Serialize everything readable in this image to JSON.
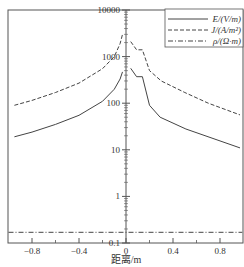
{
  "chart_data": {
    "type": "line",
    "title": "",
    "xlabel": "距离/m",
    "ylabel": "",
    "yscale": "log",
    "xlim": [
      -1.0,
      0.99
    ],
    "ylim": [
      0.1,
      10000
    ],
    "x_ticks": [
      -0.8,
      -0.4,
      0,
      0.4,
      0.8
    ],
    "x_tick_labels": [
      "−0.8",
      "−0.4",
      "0",
      "0.4",
      "0.8"
    ],
    "x_minor_ticks": [
      -0.6,
      -0.2,
      0.2,
      0.6
    ],
    "y_ticks": [
      0.1,
      1,
      10,
      100,
      1000,
      10000
    ],
    "y_tick_labels": [
      "0.1",
      "1",
      "10",
      "100",
      "1000",
      "10000"
    ],
    "y_axis_position": "x=0 (center)",
    "grid": false,
    "legend_position": "upper right",
    "legend": [
      {
        "label": "E/(V/m)",
        "style": "solid"
      },
      {
        "label": "J/(A/m²)",
        "style": "dashed"
      },
      {
        "label": "ρ/(Ω·m)",
        "style": "dashdot"
      }
    ],
    "series": [
      {
        "name": "E/(V/m)",
        "style": "solid",
        "segments": [
          {
            "x": [
              -0.95,
              -0.8,
              -0.6,
              -0.4,
              -0.2,
              -0.1,
              -0.05,
              -0.03
            ],
            "y": [
              19,
              24,
              35,
              55,
              110,
              200,
              330,
              470
            ]
          },
          {
            "x": [
              0.04,
              0.09,
              0.14,
              0.2,
              0.29,
              0.51,
              0.97
            ],
            "y": [
              560,
              370,
              370,
              90,
              50,
              28,
              11
            ]
          }
        ]
      },
      {
        "name": "J/(A/m²)",
        "style": "dashed",
        "segments": [
          {
            "x": [
              -0.95,
              -0.8,
              -0.6,
              -0.4,
              -0.2,
              -0.1,
              -0.05,
              -0.03
            ],
            "y": [
              90,
              115,
              170,
              270,
              550,
              1000,
              1900,
              3000
            ]
          },
          {
            "x": [
              0.04,
              0.09,
              0.14,
              0.2,
              0.3,
              0.5,
              0.7,
              0.97
            ],
            "y": [
              2100,
              1400,
              1400,
              500,
              300,
              170,
              100,
              56
            ]
          }
        ]
      },
      {
        "name": "ρ/(Ω·m)",
        "style": "dashdot",
        "segments": [
          {
            "x": [
              -1.0,
              0.99
            ],
            "y": [
              0.17,
              0.17
            ]
          }
        ]
      }
    ]
  }
}
